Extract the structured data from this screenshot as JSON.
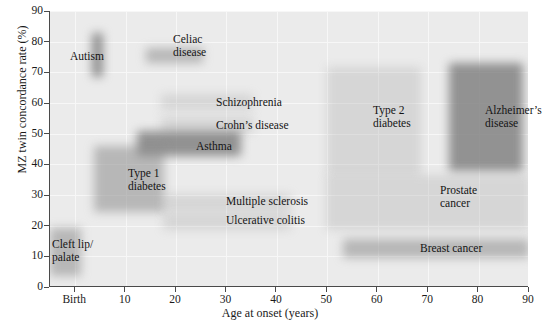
{
  "chart_data": {
    "type": "bar",
    "title": "",
    "xlabel": "Age at onset (years)",
    "ylabel": "MZ twin concordance rate (%)",
    "xlim": [
      -5,
      90
    ],
    "ylim": [
      0,
      90
    ],
    "xticks": [
      "Birth",
      "10",
      "20",
      "30",
      "40",
      "50",
      "60",
      "70",
      "80",
      "90"
    ],
    "xtick_values": [
      0,
      10,
      20,
      30,
      40,
      50,
      60,
      70,
      80,
      90
    ],
    "yticks": [
      "0",
      "10",
      "20",
      "30",
      "40",
      "50",
      "60",
      "70",
      "80",
      "90"
    ],
    "ytick_values": [
      0,
      10,
      20,
      30,
      40,
      50,
      60,
      70,
      80,
      90
    ],
    "grid": true,
    "legend": "none",
    "plot_background": "#ebebeb",
    "bar_color": "#9a9a9a",
    "items": [
      {
        "label": "Autism",
        "label_text": "Autism",
        "age_range": [
          2,
          4
        ],
        "rate_range": [
          69,
          83
        ],
        "shade": "dark",
        "bar": {
          "left": 91,
          "top": 33,
          "width": 11,
          "height": 44
        },
        "label_pos": {
          "left": 70,
          "top": 50
        }
      },
      {
        "label": "Celiac disease",
        "label_text": "Celiac\ndisease",
        "age_range": [
          13,
          24
        ],
        "rate_range": [
          73,
          78
        ],
        "shade": "mid",
        "bar": {
          "left": 145,
          "top": 48,
          "width": 57,
          "height": 15
        },
        "label_pos": {
          "left": 173,
          "top": 33
        }
      },
      {
        "label": "Schizophrenia",
        "label_text": "Schizophrenia",
        "age_range": [
          16,
          34
        ],
        "rate_range": [
          54,
          59
        ],
        "shade": "faint",
        "bar": {
          "left": 160,
          "top": 94,
          "width": 92,
          "height": 16
        },
        "label_pos": {
          "left": 216,
          "top": 96
        }
      },
      {
        "label": "Crohn's disease",
        "label_text": "Crohn’s disease",
        "age_range": [
          16,
          34
        ],
        "rate_range": [
          47,
          52
        ],
        "shade": "faint",
        "bar": {
          "left": 160,
          "top": 117,
          "width": 92,
          "height": 16
        },
        "label_pos": {
          "left": 216,
          "top": 119
        }
      },
      {
        "label": "Asthma",
        "label_text": "Asthma",
        "age_range": [
          12,
          32
        ],
        "rate_range": [
          42,
          50
        ],
        "shade": "dark",
        "bar": {
          "left": 136,
          "top": 131,
          "width": 104,
          "height": 25
        },
        "label_pos": {
          "left": 196,
          "top": 140
        }
      },
      {
        "label": "Type 1 diabetes",
        "label_text": "Type 1\ndiabetes",
        "age_range": [
          0,
          17
        ],
        "rate_range": [
          25,
          45
        ],
        "shade": "mid",
        "bar": {
          "left": 93,
          "top": 146,
          "width": 70,
          "height": 66
        },
        "label_pos": {
          "left": 128,
          "top": 167
        }
      },
      {
        "label": "Multiple sclerosis",
        "label_text": "Multiple sclerosis",
        "age_range": [
          21,
          45
        ],
        "rate_range": [
          25,
          30
        ],
        "shade": "faint",
        "bar": {
          "left": 162,
          "top": 194,
          "width": 128,
          "height": 17
        },
        "label_pos": {
          "left": 226,
          "top": 195
        }
      },
      {
        "label": "Ulcerative colitis",
        "label_text": "Ulcerative colitis",
        "age_range": [
          21,
          45
        ],
        "rate_range": [
          19,
          24
        ],
        "shade": "faint",
        "bar": {
          "left": 162,
          "top": 213,
          "width": 128,
          "height": 17
        },
        "label_pos": {
          "left": 226,
          "top": 214
        }
      },
      {
        "label": "Cleft lip/palate",
        "label_text": "Cleft lip/\npalate",
        "age_range": [
          -5,
          1
        ],
        "rate_range": [
          4,
          17
        ],
        "shade": "mid",
        "bar": {
          "left": 49,
          "top": 228,
          "width": 31,
          "height": 48
        },
        "label_pos": {
          "left": 52,
          "top": 238
        }
      },
      {
        "label": "Type 2 diabetes",
        "label_text": "Type 2\ndiabetes",
        "age_range": [
          55,
          75
        ],
        "rate_range": [
          37,
          71
        ],
        "shade": "faint",
        "bar": {
          "left": 326,
          "top": 67,
          "width": 94,
          "height": 108
        },
        "label_pos": {
          "left": 373,
          "top": 104
        }
      },
      {
        "label": "Alzheimer's disease",
        "label_text": "Alzheimer’s\ndisease",
        "age_range": [
          75,
          89
        ],
        "rate_range": [
          38,
          72
        ],
        "shade": "dark",
        "bar": {
          "left": 448,
          "top": 63,
          "width": 74,
          "height": 108
        },
        "label_pos": {
          "left": 485,
          "top": 104
        }
      },
      {
        "label": "Prostate cancer",
        "label_text": "Prostate\ncancer",
        "age_range": [
          55,
          90
        ],
        "rate_range": [
          19,
          37
        ],
        "shade": "faint",
        "bar": {
          "left": 325,
          "top": 175,
          "width": 203,
          "height": 55
        },
        "label_pos": {
          "left": 440,
          "top": 184
        }
      },
      {
        "label": "Breast cancer",
        "label_text": "Breast cancer",
        "age_range": [
          48,
          90
        ],
        "rate_range": [
          10,
          16
        ],
        "shade": "mid",
        "bar": {
          "left": 342,
          "top": 239,
          "width": 186,
          "height": 19
        },
        "label_pos": {
          "left": 420,
          "top": 242
        }
      }
    ]
  }
}
